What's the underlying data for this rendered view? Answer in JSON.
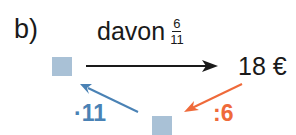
{
  "exercise": {
    "label": "b)",
    "operation_text": "davon",
    "fraction": {
      "numerator": "6",
      "denominator": "11"
    },
    "result": "18 €",
    "step_divide": ":6",
    "step_multiply": "·11"
  },
  "colors": {
    "box": "#a9c1d6",
    "multiply_arrow": "#4a82b5",
    "divide_arrow": "#ef6a3a",
    "main_arrow": "#1a1a1a"
  }
}
